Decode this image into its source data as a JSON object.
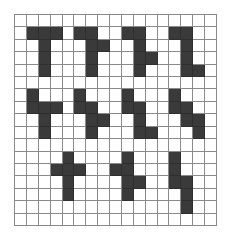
{
  "grid": {
    "rows": 17,
    "cols": 17,
    "fill_color": "#3a3a3a",
    "line_color": "#8a8a8a",
    "background_color": "#ffffff",
    "filled_cells": [
      [
        1,
        1
      ],
      [
        1,
        2
      ],
      [
        1,
        3
      ],
      [
        1,
        5
      ],
      [
        1,
        6
      ],
      [
        1,
        9
      ],
      [
        1,
        10
      ],
      [
        1,
        13
      ],
      [
        1,
        14
      ],
      [
        2,
        2
      ],
      [
        2,
        6
      ],
      [
        2,
        7
      ],
      [
        2,
        10
      ],
      [
        2,
        14
      ],
      [
        3,
        2
      ],
      [
        3,
        6
      ],
      [
        3,
        10
      ],
      [
        3,
        11
      ],
      [
        3,
        14
      ],
      [
        4,
        2
      ],
      [
        4,
        6
      ],
      [
        4,
        10
      ],
      [
        4,
        14
      ],
      [
        4,
        15
      ],
      [
        6,
        1
      ],
      [
        6,
        5
      ],
      [
        6,
        9
      ],
      [
        6,
        13
      ],
      [
        7,
        1
      ],
      [
        7,
        2
      ],
      [
        7,
        3
      ],
      [
        7,
        5
      ],
      [
        7,
        6
      ],
      [
        7,
        9
      ],
      [
        7,
        10
      ],
      [
        7,
        13
      ],
      [
        7,
        14
      ],
      [
        8,
        2
      ],
      [
        8,
        6
      ],
      [
        8,
        7
      ],
      [
        8,
        10
      ],
      [
        8,
        14
      ],
      [
        8,
        15
      ],
      [
        9,
        2
      ],
      [
        9,
        6
      ],
      [
        9,
        10
      ],
      [
        9,
        11
      ],
      [
        9,
        15
      ],
      [
        11,
        4
      ],
      [
        11,
        9
      ],
      [
        11,
        13
      ],
      [
        12,
        3
      ],
      [
        12,
        4
      ],
      [
        12,
        5
      ],
      [
        12,
        8
      ],
      [
        12,
        9
      ],
      [
        12,
        13
      ],
      [
        13,
        4
      ],
      [
        13,
        9
      ],
      [
        13,
        10
      ],
      [
        13,
        13
      ],
      [
        13,
        14
      ],
      [
        14,
        4
      ],
      [
        14,
        9
      ],
      [
        14,
        14
      ],
      [
        15,
        14
      ]
    ],
    "shapes": [
      {
        "name": "shape-r1-a",
        "cells": [
          [
            1,
            1
          ],
          [
            1,
            2
          ],
          [
            1,
            3
          ],
          [
            2,
            2
          ],
          [
            3,
            2
          ],
          [
            4,
            2
          ]
        ]
      },
      {
        "name": "shape-r1-b",
        "cells": [
          [
            1,
            5
          ],
          [
            1,
            6
          ],
          [
            2,
            6
          ],
          [
            2,
            7
          ],
          [
            3,
            6
          ],
          [
            4,
            6
          ]
        ]
      },
      {
        "name": "shape-r1-c",
        "cells": [
          [
            1,
            9
          ],
          [
            1,
            10
          ],
          [
            2,
            10
          ],
          [
            3,
            10
          ],
          [
            3,
            11
          ],
          [
            4,
            10
          ]
        ]
      },
      {
        "name": "shape-r1-d",
        "cells": [
          [
            1,
            13
          ],
          [
            1,
            14
          ],
          [
            2,
            14
          ],
          [
            3,
            14
          ],
          [
            4,
            14
          ],
          [
            4,
            15
          ]
        ]
      },
      {
        "name": "shape-r2-a",
        "cells": [
          [
            6,
            1
          ],
          [
            7,
            1
          ],
          [
            7,
            2
          ],
          [
            7,
            3
          ],
          [
            8,
            2
          ],
          [
            9,
            2
          ]
        ]
      },
      {
        "name": "shape-r2-b",
        "cells": [
          [
            6,
            5
          ],
          [
            7,
            5
          ],
          [
            7,
            6
          ],
          [
            8,
            6
          ],
          [
            8,
            7
          ],
          [
            9,
            6
          ]
        ]
      },
      {
        "name": "shape-r2-c",
        "cells": [
          [
            6,
            9
          ],
          [
            7,
            9
          ],
          [
            7,
            10
          ],
          [
            8,
            10
          ],
          [
            9,
            10
          ],
          [
            9,
            11
          ]
        ]
      },
      {
        "name": "shape-r2-d",
        "cells": [
          [
            6,
            13
          ],
          [
            7,
            13
          ],
          [
            7,
            14
          ],
          [
            8,
            14
          ],
          [
            8,
            15
          ],
          [
            9,
            15
          ]
        ]
      },
      {
        "name": "shape-r3-a",
        "cells": [
          [
            11,
            4
          ],
          [
            12,
            3
          ],
          [
            12,
            4
          ],
          [
            12,
            5
          ],
          [
            13,
            4
          ],
          [
            14,
            4
          ]
        ]
      },
      {
        "name": "shape-r3-b",
        "cells": [
          [
            11,
            9
          ],
          [
            12,
            8
          ],
          [
            12,
            9
          ],
          [
            13,
            9
          ],
          [
            13,
            10
          ],
          [
            14,
            9
          ]
        ]
      },
      {
        "name": "shape-r3-c",
        "cells": [
          [
            11,
            13
          ],
          [
            12,
            13
          ],
          [
            13,
            13
          ],
          [
            13,
            14
          ],
          [
            14,
            14
          ],
          [
            15,
            14
          ]
        ]
      }
    ]
  }
}
